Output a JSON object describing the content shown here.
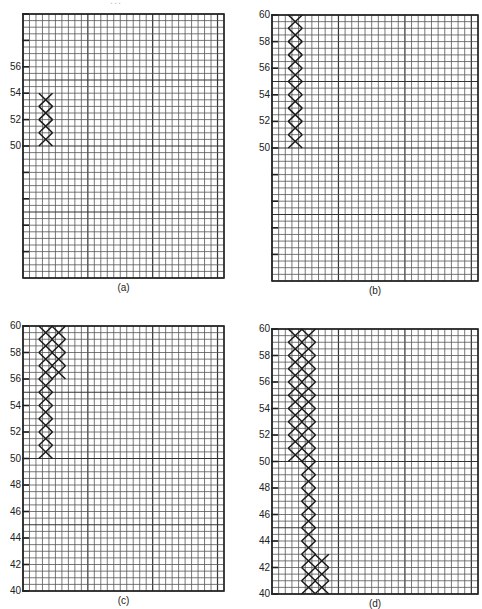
{
  "header": {
    "text": "..."
  },
  "panels": [
    {
      "id": "a",
      "caption": "(a)",
      "x": 23,
      "y": 14,
      "w": 201,
      "h": 264,
      "y_labels": [
        "56",
        "54",
        "52",
        "50"
      ],
      "y_label_values": [
        56,
        54,
        52,
        50
      ],
      "unlabeled_ticks": [
        60,
        58,
        48,
        46,
        44,
        42
      ]
    },
    {
      "id": "b",
      "caption": "(b)",
      "x": 272,
      "y": 15,
      "w": 206,
      "h": 266,
      "y_labels": [
        "60",
        "58",
        "56",
        "54",
        "52",
        "50"
      ],
      "y_label_values": [
        60,
        58,
        56,
        54,
        52,
        50
      ],
      "unlabeled_ticks": [
        48,
        46,
        44,
        42
      ]
    },
    {
      "id": "c",
      "caption": "(c)",
      "x": 23,
      "y": 326,
      "w": 201,
      "h": 265,
      "y_labels": [
        "60",
        "58",
        "56",
        "54",
        "52",
        "50",
        "48",
        "46",
        "44",
        "42",
        "40"
      ],
      "y_label_values": [
        60,
        58,
        56,
        54,
        52,
        50,
        48,
        46,
        44,
        42,
        40
      ],
      "unlabeled_ticks": []
    },
    {
      "id": "d",
      "caption": "(d)",
      "x": 272,
      "y": 329,
      "w": 206,
      "h": 265,
      "y_labels": [
        "60",
        "58",
        "56",
        "54",
        "52",
        "50",
        "48",
        "46",
        "44",
        "42",
        "40"
      ],
      "y_label_values": [
        60,
        58,
        56,
        54,
        52,
        50,
        48,
        46,
        44,
        42,
        40
      ],
      "unlabeled_ticks": []
    }
  ],
  "chart_data": {
    "type": "diagram",
    "ylim": [
      40,
      60
    ],
    "grid": {
      "minor_cells_per_unit": 2,
      "columns": 31,
      "rows": 40,
      "major_every_cells": 10
    },
    "chains": {
      "a": [
        {
          "column": 1,
          "from": 50,
          "to": 54
        }
      ],
      "b": [
        {
          "column": 1,
          "from": 50,
          "to": 60
        }
      ],
      "c": [
        {
          "column": 1,
          "from": 50,
          "to": 60
        },
        {
          "column": 2,
          "from": 56,
          "to": 60
        }
      ],
      "d": [
        {
          "column": 1,
          "from": 50,
          "to": 60
        },
        {
          "column": 2,
          "from": 40,
          "to": 60
        },
        {
          "column": 3,
          "from": 40,
          "to": 43
        }
      ]
    }
  }
}
